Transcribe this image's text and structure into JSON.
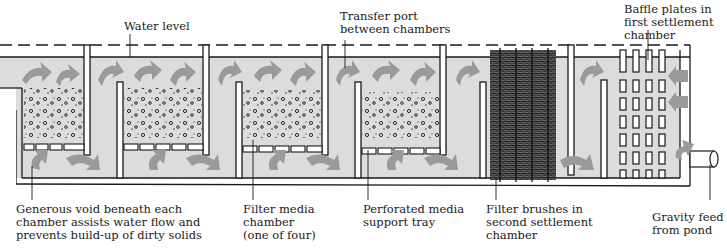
{
  "diagram": {
    "title": "",
    "colors": {
      "water": "#dcdcdc",
      "arrow": "#9a9a9a",
      "line": "#1a1a1a",
      "background": "#ffffff"
    },
    "labels": {
      "water_level": "Water level",
      "transfer_port": "Transfer port\nbetween chambers",
      "baffle_plates": "Baffle plates in\nfirst settlement\nchamber",
      "generous_void": "Generous void beneath each\nchamber assists water flow and\nprevents build-up of dirty solids",
      "filter_media_chamber": "Filter media\nchamber\n(one of four)",
      "perforated_tray": "Perforated media\nsupport tray",
      "filter_brushes": "Filter brushes in\nsecond settlement\nchamber",
      "gravity_feed": "Gravity feed\nfrom pond"
    },
    "components": [
      {
        "name": "filter-media-chamber-1"
      },
      {
        "name": "filter-media-chamber-2"
      },
      {
        "name": "filter-media-chamber-3"
      },
      {
        "name": "filter-media-chamber-4"
      },
      {
        "name": "second-settlement-chamber",
        "contents": "filter brushes"
      },
      {
        "name": "first-settlement-chamber",
        "contents": "baffle plates"
      },
      {
        "name": "inlet-pipe",
        "description": "gravity feed from pond"
      }
    ]
  }
}
